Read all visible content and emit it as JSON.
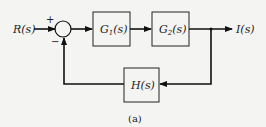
{
  "diagram": {
    "type": "block-diagram",
    "caption": "(a)",
    "input": {
      "label": "R(s)"
    },
    "output": {
      "label": "I(s)"
    },
    "summing_junction": {
      "plus_sign": "+",
      "minus_sign": "−"
    },
    "blocks": [
      {
        "id": "g1",
        "label": "G1(s)",
        "main": "G",
        "sub": "1",
        "arg": "(s)"
      },
      {
        "id": "g2",
        "label": "G2(s)",
        "main": "G",
        "sub": "2",
        "arg": "(s)"
      },
      {
        "id": "h",
        "label": "H(s)"
      }
    ],
    "connections": [
      {
        "from": "R(s)",
        "to": "summing_junction",
        "sign": "+"
      },
      {
        "from": "summing_junction",
        "to": "G1(s)"
      },
      {
        "from": "G1(s)",
        "to": "G2(s)"
      },
      {
        "from": "G2(s)",
        "to": "I(s)"
      },
      {
        "from": "I(s) branch",
        "to": "H(s)"
      },
      {
        "from": "H(s)",
        "to": "summing_junction",
        "sign": "−"
      }
    ],
    "colors": {
      "line": "#111111",
      "background": "#f4f4f2"
    }
  }
}
